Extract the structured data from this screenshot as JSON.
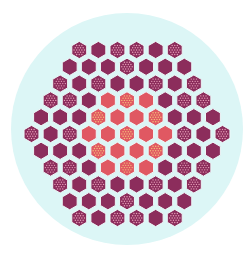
{
  "diagram": {
    "title": "",
    "background": "#ffffff",
    "vessel": {
      "cx": 127,
      "cy": 129,
      "r": 116,
      "fill": "#dcf6f6"
    },
    "lattice": {
      "type": "hexagonal",
      "orientation": "pointy-top",
      "center_x": 127,
      "center_y": 134,
      "dx": 19.1,
      "dy": 16.8,
      "hex_radius": 8.6,
      "gap_color": "#eef7f8"
    },
    "legend": {
      "D": {
        "label": "outer assembly",
        "fill": "#8c2d5c",
        "dotted": false
      },
      "Dd": {
        "label": "outer assembly (with rods)",
        "fill": "#8c2d5c",
        "dotted": true,
        "dot_color": "#e7a0b8"
      },
      "R": {
        "label": "inner assembly",
        "fill": "#e05862",
        "dotted": false
      },
      "Rd": {
        "label": "inner assembly (with rods)",
        "fill": "#e05862",
        "dotted": true,
        "dot_color": "#f4c27a"
      }
    },
    "rows": [
      [
        "Dd",
        "D",
        "Dd",
        "Dd",
        "D",
        "Dd"
      ],
      [
        "D",
        "D",
        "D",
        "Dd",
        "D",
        "D",
        "D"
      ],
      [
        "Dd",
        "D",
        "Dd",
        "D",
        "D",
        "Dd",
        "D",
        "Dd"
      ],
      [
        "Dd",
        "Dd",
        "D",
        "R",
        "Rd",
        "R",
        "D",
        "Dd",
        "Dd"
      ],
      [
        "D",
        "D",
        "D",
        "Rd",
        "R",
        "R",
        "Rd",
        "D",
        "D",
        "D"
      ],
      [
        "Dd",
        "D",
        "Dd",
        "R",
        "R",
        "Rd",
        "R",
        "R",
        "Dd",
        "D",
        "Dd"
      ],
      [
        "D",
        "D",
        "D",
        "Rd",
        "R",
        "R",
        "Rd",
        "D",
        "D",
        "D"
      ],
      [
        "Dd",
        "Dd",
        "D",
        "R",
        "Rd",
        "R",
        "D",
        "Dd",
        "Dd"
      ],
      [
        "Dd",
        "D",
        "Dd",
        "D",
        "D",
        "Dd",
        "D",
        "Dd"
      ],
      [
        "D",
        "D",
        "D",
        "Dd",
        "D",
        "D",
        "D"
      ],
      [
        "Dd",
        "D",
        "Dd",
        "Dd",
        "D",
        "Dd"
      ]
    ]
  }
}
